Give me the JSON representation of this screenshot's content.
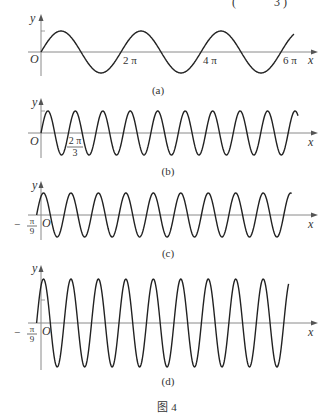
{
  "figure": {
    "header_fragment": "( — 3 )",
    "caption": "图 4",
    "panels": [
      {
        "id": "a",
        "label": "(a)",
        "y_axis_label": "y",
        "x_axis_label": "x",
        "origin_label": "O",
        "tick_labels": [
          "2 π",
          "4 π",
          "6 π"
        ],
        "function": "y = A sin(x)",
        "period": "2π"
      },
      {
        "id": "b",
        "label": "(b)",
        "y_axis_label": "y",
        "x_axis_label": "x",
        "origin_label": "O",
        "tick_labels": [
          "2π/3"
        ],
        "tick_num": "2 π",
        "tick_den": "3",
        "function": "y = A sin(3x)",
        "period": "2π/3"
      },
      {
        "id": "c",
        "label": "(c)",
        "y_axis_label": "y",
        "x_axis_label": "x",
        "origin_label": "O",
        "shift_label": "−π/9",
        "shift_sign": "−",
        "shift_num": "π",
        "shift_den": "9",
        "function": "y = A sin(3x + π/3)",
        "period": "2π/3"
      },
      {
        "id": "d",
        "label": "(d)",
        "y_axis_label": "y",
        "x_axis_label": "x",
        "origin_label": "O",
        "shift_label": "−π/9",
        "shift_sign": "−",
        "shift_num": "π",
        "shift_den": "9",
        "function": "y = 2A sin(3x + π/3)",
        "period": "2π/3"
      }
    ]
  },
  "chart_data": [
    {
      "type": "line",
      "title": "(a)",
      "xlabel": "x",
      "ylabel": "y",
      "x_ticks": [
        "2π",
        "4π",
        "6π"
      ],
      "x_range": [
        0,
        "~6.3π"
      ],
      "amplitude": 1,
      "period": "2π",
      "phase_shift": 0,
      "description": "sine wave y = sin x, three full periods"
    },
    {
      "type": "line",
      "title": "(b)",
      "xlabel": "x",
      "ylabel": "y",
      "x_ticks": [
        "2π/3"
      ],
      "amplitude": 1,
      "period": "2π/3",
      "phase_shift": 0,
      "description": "y = sin 3x, about 9.3 periods"
    },
    {
      "type": "line",
      "title": "(c)",
      "xlabel": "x",
      "ylabel": "y",
      "x_ticks": [
        "-π/9"
      ],
      "amplitude": 1,
      "period": "2π/3",
      "phase_shift": "-π/9",
      "description": "y = sin(3x + π/3), shifted left by π/9"
    },
    {
      "type": "line",
      "title": "(d)",
      "xlabel": "x",
      "ylabel": "y",
      "x_ticks": [
        "-π/9"
      ],
      "amplitude": 2,
      "period": "2π/3",
      "phase_shift": "-π/9",
      "description": "y = 2 sin(3x + π/3), doubled amplitude"
    }
  ]
}
